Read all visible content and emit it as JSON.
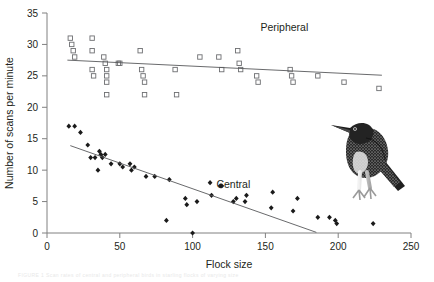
{
  "figure": {
    "caption_faint": "FIGURE 1  Scan rates of central and peripheral birds in starling flocks of varying size"
  },
  "chart_data": {
    "type": "scatter",
    "title": "",
    "xlabel": "Flock size",
    "ylabel": "Number of scans per minute",
    "xlim": [
      0,
      250
    ],
    "ylim": [
      0,
      35
    ],
    "xticks": [
      0,
      50,
      100,
      150,
      200,
      250
    ],
    "yticks": [
      0,
      5,
      10,
      15,
      20,
      25,
      30,
      35
    ],
    "grid": false,
    "legend_position": "inline-annotation",
    "annotations": [
      {
        "text": "Peripheral",
        "x": 163,
        "y": 32.2
      },
      {
        "text": "Central",
        "x": 128,
        "y": 7.2
      }
    ],
    "series": [
      {
        "name": "Peripheral",
        "marker": "open-square",
        "color": "#6d6e71",
        "points": [
          [
            16,
            31
          ],
          [
            17,
            30
          ],
          [
            18,
            29
          ],
          [
            19,
            28
          ],
          [
            31,
            31
          ],
          [
            31,
            29
          ],
          [
            31,
            26
          ],
          [
            32,
            25
          ],
          [
            39,
            28
          ],
          [
            40,
            27
          ],
          [
            41,
            26
          ],
          [
            41,
            25
          ],
          [
            41,
            24
          ],
          [
            41,
            22
          ],
          [
            49,
            27
          ],
          [
            50,
            27
          ],
          [
            64,
            29
          ],
          [
            65,
            26
          ],
          [
            66,
            25
          ],
          [
            67,
            24
          ],
          [
            67,
            22
          ],
          [
            88,
            26
          ],
          [
            89,
            22
          ],
          [
            105,
            28
          ],
          [
            118,
            28
          ],
          [
            120,
            26
          ],
          [
            131,
            29
          ],
          [
            132,
            27
          ],
          [
            133,
            26
          ],
          [
            144,
            25
          ],
          [
            145,
            24
          ],
          [
            167,
            26
          ],
          [
            168,
            25
          ],
          [
            169,
            24
          ],
          [
            186,
            25
          ],
          [
            204,
            24
          ],
          [
            228,
            23
          ]
        ]
      },
      {
        "name": "Central",
        "marker": "filled-diamond",
        "color": "#1a1a1a",
        "points": [
          [
            15,
            17
          ],
          [
            19,
            17
          ],
          [
            23,
            16
          ],
          [
            28,
            14
          ],
          [
            30,
            12
          ],
          [
            33,
            12
          ],
          [
            35,
            10
          ],
          [
            36,
            13
          ],
          [
            37,
            12.5
          ],
          [
            38,
            12
          ],
          [
            40,
            12.5
          ],
          [
            44,
            11
          ],
          [
            50,
            11
          ],
          [
            52,
            10.5
          ],
          [
            57,
            11
          ],
          [
            58,
            10
          ],
          [
            60,
            10.5
          ],
          [
            68,
            9
          ],
          [
            74,
            9
          ],
          [
            82,
            2
          ],
          [
            84,
            8.5
          ],
          [
            95,
            5.5
          ],
          [
            96,
            4.5
          ],
          [
            100,
            0
          ],
          [
            103,
            5
          ],
          [
            112,
            8
          ],
          [
            113,
            6
          ],
          [
            119,
            7.5
          ],
          [
            120,
            7.5
          ],
          [
            128,
            5
          ],
          [
            130,
            5.5
          ],
          [
            136,
            5
          ],
          [
            137,
            6
          ],
          [
            154,
            4
          ],
          [
            155,
            6.5
          ],
          [
            169,
            3.5
          ],
          [
            172,
            5.5
          ],
          [
            186,
            2.5
          ],
          [
            194,
            2.5
          ],
          [
            198,
            2
          ],
          [
            199,
            1.5
          ],
          [
            224,
            1.5
          ]
        ]
      }
    ],
    "trendlines": [
      {
        "series": "Peripheral",
        "x0": 14,
        "y0": 27.5,
        "x1": 230,
        "y1": 25.1
      },
      {
        "series": "Central",
        "x0": 16,
        "y0": 13.9,
        "x1": 185,
        "y1": 0.1
      }
    ]
  }
}
